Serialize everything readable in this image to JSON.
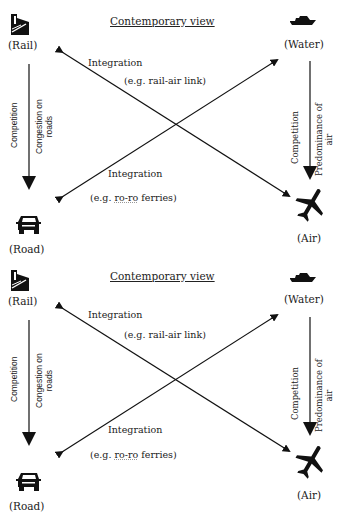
{
  "panels": [
    {
      "title": "Contemporary view",
      "nodes": {
        "rail": {
          "label": "(Rail)",
          "icon": "train-icon"
        },
        "water": {
          "label": "(Water)",
          "icon": "ship-icon"
        },
        "road": {
          "label": "(Road)",
          "icon": "car-icon"
        },
        "air": {
          "label": "(Air)",
          "icon": "airplane-icon"
        }
      },
      "edges": {
        "rail_air": {
          "label": "Integration",
          "example": "(e.g. rail-air link)"
        },
        "road_water": {
          "label": "Integration",
          "example_prefix": "(e.g. ",
          "example_term": "ro-ro",
          "example_suffix": " ferries)"
        },
        "rail_road": {
          "label": "Competition",
          "note_line1": "Congestion on",
          "note_line2": "roads"
        },
        "water_air": {
          "label": "Competition",
          "note_line1": "Predominance of",
          "note_line2": "air"
        }
      }
    },
    {
      "title": "Contemporary view",
      "nodes": {
        "rail": {
          "label": "(Rail)",
          "icon": "train-icon"
        },
        "water": {
          "label": "(Water)",
          "icon": "ship-icon"
        },
        "road": {
          "label": "(Road)",
          "icon": "car-icon"
        },
        "air": {
          "label": "(Air)",
          "icon": "airplane-icon"
        }
      },
      "edges": {
        "rail_air": {
          "label": "Integration",
          "example": "(e.g. rail-air link)"
        },
        "road_water": {
          "label": "Integration",
          "example_prefix": "(e.g. ",
          "example_term": "ro-ro",
          "example_suffix": " ferries)"
        },
        "rail_road": {
          "label": "Competition",
          "note_line1": "Congestion on",
          "note_line2": "roads"
        },
        "water_air": {
          "label": "Competition",
          "note_line1": "Predominance of",
          "note_line2": "air"
        }
      }
    }
  ],
  "colors": {
    "ink": "#111111",
    "text": "#222222",
    "background": "#ffffff"
  }
}
